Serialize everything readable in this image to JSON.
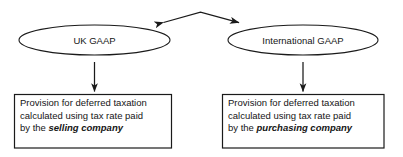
{
  "diagram": {
    "colors": {
      "stroke": "#1a1a1a",
      "text": "#151515",
      "background": "#ffffff"
    },
    "nodes": {
      "ellipse_left": {
        "label": "UK GAAP",
        "shape": "ellipse"
      },
      "ellipse_right": {
        "label": "International GAAP",
        "shape": "ellipse"
      },
      "box_left": {
        "shape": "rectangle",
        "line1": "Provision for deferred taxation",
        "line2": "calculated using tax rate paid",
        "line3_prefix": "by the ",
        "line3_emphasis": "selling company"
      },
      "box_right": {
        "shape": "rectangle",
        "line1": "Provision for deferred taxation",
        "line2": "calculated using tax rate paid",
        "line3_prefix": "by the ",
        "line3_emphasis": "purchasing company"
      }
    },
    "connectors": {
      "top_double_arrow": {
        "name": "bidirectional-arrow",
        "from": "UK GAAP",
        "to": "International GAAP",
        "arrowheads": "both"
      },
      "left_down_arrow": {
        "name": "down-arrow",
        "from": "UK GAAP",
        "to": "box_left",
        "arrowheads": "end"
      },
      "right_down_arrow": {
        "name": "down-arrow",
        "from": "International GAAP",
        "to": "box_right",
        "arrowheads": "end"
      }
    }
  }
}
